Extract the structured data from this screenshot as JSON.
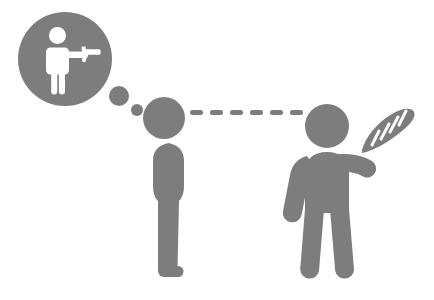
{
  "illustration": {
    "title": "Pictogram: person imagining a gun while another offers bread",
    "canvas": {
      "width": 434,
      "height": 300,
      "background": "#ffffff"
    },
    "palette": {
      "figure_gray": "#7d7d7d",
      "bubble_gray": "#7d7d7d",
      "inner_figure": "#ffffff",
      "background": "#ffffff"
    },
    "thought_bubble": {
      "label": "thought bubble",
      "circle": {
        "cx": 65,
        "cy": 59,
        "r": 47
      },
      "trail_dots": [
        {
          "cx": 119,
          "cy": 96,
          "r": 10
        },
        {
          "cx": 137,
          "cy": 110,
          "r": 6
        }
      ],
      "inner_scene_label": "person aiming a handgun"
    },
    "sight_line": {
      "label": "line of sight dashes",
      "dash_count": 6,
      "y": 112,
      "x_start": 190,
      "dash_length": 12,
      "dash_gap": 7,
      "thickness": 5
    },
    "left_figure": {
      "label": "standing person viewing",
      "head": {
        "cx": 164,
        "cy": 118,
        "r": 21
      },
      "body_x": 145,
      "body_y": 142
    },
    "right_figure": {
      "label": "person offering bread",
      "head": {
        "cx": 327,
        "cy": 126,
        "r": 22
      },
      "held_object": "baguette",
      "baguette_score_marks": 4
    }
  }
}
